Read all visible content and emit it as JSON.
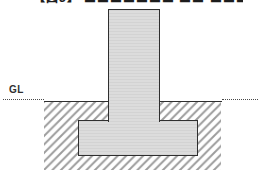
{
  "figure": {
    "caption": "【図3】 〓〓〓〓〓〓〓 〓〓 〓〓〓〓〓〓",
    "type": "foundation-cross-section-diagram"
  },
  "labels": {
    "ground_level": "GL"
  },
  "colors": {
    "background": "#ffffff",
    "concrete_fill": "#d8d8d8",
    "outline": "#2f2f2f",
    "hatch_line": "#9c9c9c",
    "gl_text": "#303030",
    "dotted_line": "#4a4a4a"
  }
}
